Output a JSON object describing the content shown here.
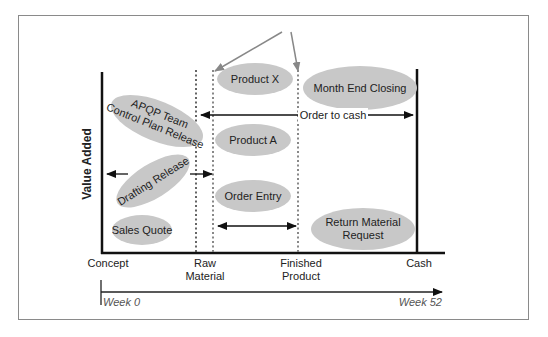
{
  "diagram": {
    "y_axis_label": "Value Added",
    "x_axis_ticks": [
      {
        "label_line1": "Concept",
        "label_line2": ""
      },
      {
        "label_line1": "Raw",
        "label_line2": "Material"
      },
      {
        "label_line1": "Finished",
        "label_line2": "Product"
      },
      {
        "label_line1": "Cash",
        "label_line2": ""
      }
    ],
    "timeline": {
      "start": "Week 0",
      "end": "Week 52"
    },
    "bubbles": {
      "product_x": "Product X",
      "month_end": "Month End Closing",
      "apqp_line1": "APQP Team",
      "apqp_line2": "Control Plan Release",
      "product_a": "Product A",
      "drafting": "Drafting Release",
      "order_entry": "Order Entry",
      "sales_quote": "Sales Quote",
      "return_line1": "Return Material",
      "return_line2": "Request"
    },
    "arrow_labels": {
      "order_to_cash": "Order to cash"
    },
    "colors": {
      "bubble_fill": "#c8c8c8",
      "line": "#111111",
      "grey_line": "#888888"
    }
  }
}
